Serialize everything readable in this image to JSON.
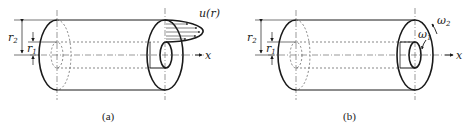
{
  "figure": {
    "panels": [
      {
        "id": "a",
        "caption": "(a)",
        "labels": {
          "outer_radius": "r",
          "outer_sub": "2",
          "inner_radius": "r",
          "inner_sub": "1",
          "velocity_profile": "u(r)",
          "axis": "x"
        },
        "description": "Annular cylinder with axial velocity profile u(r) between inner radius r1 and outer radius r2"
      },
      {
        "id": "b",
        "caption": "(b)",
        "labels": {
          "outer_radius": "r",
          "outer_sub": "2",
          "inner_radius": "r",
          "inner_sub": "1",
          "outer_rotation": "ω",
          "outer_rotation_sub": "2",
          "inner_rotation": "ω",
          "inner_rotation_sub": "1",
          "axis": "x"
        },
        "description": "Annular cylinder with inner cylinder rotating at ω1 and outer cylinder rotating at ω2"
      }
    ]
  }
}
